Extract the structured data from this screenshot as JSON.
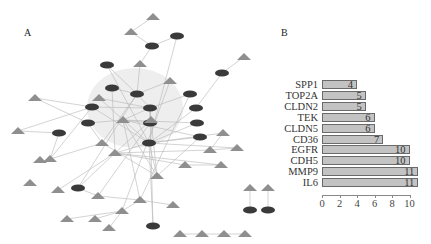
{
  "panels": {
    "a_label": "A",
    "b_label": "B"
  },
  "network": {
    "node_colors": {
      "triangle": "#8f8f8f",
      "ellipse": "#3a3a3a",
      "edge": "#b5b5b5",
      "highlight": "#ececec"
    },
    "nodes": [
      {
        "shape": "tri",
        "x": 153,
        "y": 17
      },
      {
        "shape": "tri",
        "x": 131,
        "y": 32
      },
      {
        "shape": "ell",
        "x": 177,
        "y": 36
      },
      {
        "shape": "ell",
        "x": 152,
        "y": 46
      },
      {
        "shape": "tri",
        "x": 140,
        "y": 64
      },
      {
        "shape": "ell",
        "x": 107,
        "y": 65
      },
      {
        "shape": "tri",
        "x": 244,
        "y": 57
      },
      {
        "shape": "ell",
        "x": 222,
        "y": 73
      },
      {
        "shape": "ell",
        "x": 112,
        "y": 88
      },
      {
        "shape": "tri",
        "x": 170,
        "y": 81
      },
      {
        "shape": "ell",
        "x": 137,
        "y": 94
      },
      {
        "shape": "ell",
        "x": 190,
        "y": 94
      },
      {
        "shape": "tri",
        "x": 99,
        "y": 98
      },
      {
        "shape": "tri",
        "x": 35,
        "y": 98
      },
      {
        "shape": "ell",
        "x": 92,
        "y": 107
      },
      {
        "shape": "ell",
        "x": 150,
        "y": 108
      },
      {
        "shape": "tri",
        "x": 123,
        "y": 120
      },
      {
        "shape": "ell",
        "x": 88,
        "y": 123
      },
      {
        "shape": "ell",
        "x": 150,
        "y": 123
      },
      {
        "shape": "ell",
        "x": 196,
        "y": 108
      },
      {
        "shape": "ell",
        "x": 197,
        "y": 123
      },
      {
        "shape": "tri",
        "x": 151,
        "y": 120
      },
      {
        "shape": "tri",
        "x": 18,
        "y": 131
      },
      {
        "shape": "ell",
        "x": 59,
        "y": 133
      },
      {
        "shape": "tri",
        "x": 102,
        "y": 143
      },
      {
        "shape": "ell",
        "x": 149,
        "y": 143
      },
      {
        "shape": "tri",
        "x": 115,
        "y": 153
      },
      {
        "shape": "tri",
        "x": 50,
        "y": 159
      },
      {
        "shape": "ell",
        "x": 200,
        "y": 137
      },
      {
        "shape": "tri",
        "x": 223,
        "y": 133
      },
      {
        "shape": "tri",
        "x": 210,
        "y": 150
      },
      {
        "shape": "tri",
        "x": 237,
        "y": 148
      },
      {
        "shape": "tri",
        "x": 185,
        "y": 165
      },
      {
        "shape": "tri",
        "x": 221,
        "y": 165
      },
      {
        "shape": "tri",
        "x": 157,
        "y": 176
      },
      {
        "shape": "tri",
        "x": 58,
        "y": 190
      },
      {
        "shape": "ell",
        "x": 78,
        "y": 188
      },
      {
        "shape": "tri",
        "x": 98,
        "y": 196
      },
      {
        "shape": "tri",
        "x": 140,
        "y": 200
      },
      {
        "shape": "tri",
        "x": 122,
        "y": 211
      },
      {
        "shape": "tri",
        "x": 173,
        "y": 205
      },
      {
        "shape": "tri",
        "x": 67,
        "y": 219
      },
      {
        "shape": "tri",
        "x": 95,
        "y": 219
      },
      {
        "shape": "tri",
        "x": 109,
        "y": 228
      },
      {
        "shape": "ell",
        "x": 153,
        "y": 226
      },
      {
        "shape": "tri",
        "x": 250,
        "y": 188
      },
      {
        "shape": "ell",
        "x": 250,
        "y": 210
      },
      {
        "shape": "ell",
        "x": 268,
        "y": 210
      },
      {
        "shape": "tri",
        "x": 268,
        "y": 188
      },
      {
        "shape": "tri",
        "x": 180,
        "y": 234
      },
      {
        "shape": "tri",
        "x": 202,
        "y": 234
      },
      {
        "shape": "tri",
        "x": 224,
        "y": 234
      },
      {
        "shape": "tri",
        "x": 245,
        "y": 234
      },
      {
        "shape": "tri",
        "x": 40,
        "y": 160
      },
      {
        "shape": "tri",
        "x": 30,
        "y": 183
      }
    ],
    "edges": [
      [
        0,
        1
      ],
      [
        1,
        3
      ],
      [
        2,
        3
      ],
      [
        3,
        4
      ],
      [
        4,
        10
      ],
      [
        5,
        10
      ],
      [
        6,
        7
      ],
      [
        7,
        19
      ],
      [
        8,
        10
      ],
      [
        9,
        10
      ],
      [
        10,
        15
      ],
      [
        11,
        15
      ],
      [
        12,
        15
      ],
      [
        13,
        14
      ],
      [
        13,
        17
      ],
      [
        14,
        15
      ],
      [
        15,
        16
      ],
      [
        15,
        18
      ],
      [
        15,
        21
      ],
      [
        16,
        18
      ],
      [
        17,
        24
      ],
      [
        19,
        25
      ],
      [
        20,
        25
      ],
      [
        21,
        26
      ],
      [
        22,
        14
      ],
      [
        22,
        23
      ],
      [
        23,
        27
      ],
      [
        24,
        27
      ],
      [
        25,
        26
      ],
      [
        25,
        28
      ],
      [
        25,
        29
      ],
      [
        25,
        31
      ],
      [
        26,
        30
      ],
      [
        26,
        33
      ],
      [
        26,
        35
      ],
      [
        26,
        36
      ],
      [
        27,
        14
      ],
      [
        28,
        16
      ],
      [
        29,
        30
      ],
      [
        30,
        31
      ],
      [
        32,
        26
      ],
      [
        32,
        33
      ],
      [
        34,
        25
      ],
      [
        34,
        16
      ],
      [
        36,
        37
      ],
      [
        37,
        38
      ],
      [
        38,
        39
      ],
      [
        38,
        40
      ],
      [
        39,
        41
      ],
      [
        39,
        42
      ],
      [
        39,
        43
      ],
      [
        44,
        25
      ],
      [
        45,
        46
      ],
      [
        47,
        48
      ],
      [
        49,
        50
      ],
      [
        50,
        51
      ],
      [
        51,
        52
      ],
      [
        10,
        24
      ],
      [
        12,
        25
      ],
      [
        21,
        34
      ],
      [
        18,
        37
      ],
      [
        16,
        38
      ],
      [
        8,
        26
      ],
      [
        5,
        25
      ],
      [
        9,
        39
      ],
      [
        11,
        38
      ],
      [
        20,
        16
      ],
      [
        14,
        25
      ],
      [
        17,
        16
      ],
      [
        24,
        34
      ],
      [
        28,
        34
      ],
      [
        2,
        25
      ],
      [
        10,
        36
      ],
      [
        15,
        44
      ]
    ]
  },
  "chart_data": {
    "type": "bar",
    "orientation": "horizontal",
    "title": "",
    "xlabel": "",
    "ylabel": "",
    "categories": [
      "SPP1",
      "TOP2A",
      "CLDN2",
      "TEK",
      "CLDN5",
      "CD36",
      "EGFR",
      "CDH5",
      "MMP9",
      "IL6"
    ],
    "values": [
      4,
      5,
      5,
      6,
      6,
      7,
      10,
      10,
      11,
      11
    ],
    "xlim": [
      0,
      11.5
    ],
    "xticks": [
      0,
      2,
      4,
      6,
      8,
      10
    ],
    "data_labels": true,
    "grid": false,
    "legend": null,
    "bar_color": "#c3c3c3"
  },
  "bar_labels": {
    "cats": [
      "SPP1",
      "TOP2A",
      "CLDN2",
      "TEK",
      "CLDN5",
      "CD36",
      "EGFR",
      "CDH5",
      "MMP9",
      "IL6"
    ],
    "vals": [
      "4",
      "5",
      "5",
      "6",
      "6",
      "7",
      "10",
      "10",
      "11",
      "11"
    ],
    "ticks": [
      "0",
      "2",
      "4",
      "6",
      "8",
      "10"
    ]
  }
}
